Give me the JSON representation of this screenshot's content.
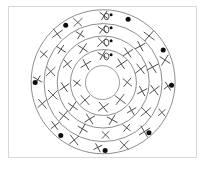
{
  "figure": {
    "background_color": "#ffffff",
    "border_color": "#d8d8d8",
    "ring_stroke_color": "#7a7a7a",
    "x_mark_color": "#4a4a4a",
    "dot_color": "#0d0d0d",
    "center_x": 103,
    "center_y": 82,
    "ring_count": 5,
    "label_text": "X0",
    "label_count": 4
  },
  "chart_data": {
    "type": "scatter",
    "xlabel": "",
    "ylabel": "",
    "grid": false,
    "legend": null,
    "coordinate_system": "polar",
    "center": {
      "x": 103,
      "y": 82
    },
    "rings": [
      {
        "name": "ring-1-outer",
        "radius": 72
      },
      {
        "name": "ring-2",
        "radius": 59
      },
      {
        "name": "ring-3",
        "radius": 46
      },
      {
        "name": "ring-4",
        "radius": 33
      },
      {
        "name": "ring-5-core",
        "radius": 17
      }
    ],
    "series": [
      {
        "name": "x-marks",
        "marker": "x",
        "color": "#4a4a4a",
        "points": [
          {
            "r": 65.5,
            "theta": 90
          },
          {
            "r": 65.5,
            "theta": 112
          },
          {
            "r": 65.5,
            "theta": 133
          },
          {
            "r": 65.5,
            "theta": 155
          },
          {
            "r": 65.5,
            "theta": 178
          },
          {
            "r": 65.5,
            "theta": 200
          },
          {
            "r": 65.5,
            "theta": 222
          },
          {
            "r": 65.5,
            "theta": 244
          },
          {
            "r": 65.5,
            "theta": 266
          },
          {
            "r": 65.5,
            "theta": 288
          },
          {
            "r": 65.5,
            "theta": 310
          },
          {
            "r": 65.5,
            "theta": 333
          },
          {
            "r": 65.5,
            "theta": 356
          },
          {
            "r": 65.5,
            "theta": 20
          },
          {
            "r": 65.5,
            "theta": 44
          },
          {
            "r": 52.5,
            "theta": 90
          },
          {
            "r": 52.5,
            "theta": 116
          },
          {
            "r": 52.5,
            "theta": 142
          },
          {
            "r": 52.5,
            "theta": 168
          },
          {
            "r": 52.5,
            "theta": 194
          },
          {
            "r": 52.5,
            "theta": 220
          },
          {
            "r": 52.5,
            "theta": 246
          },
          {
            "r": 52.5,
            "theta": 272
          },
          {
            "r": 52.5,
            "theta": 298
          },
          {
            "r": 52.5,
            "theta": 324
          },
          {
            "r": 52.5,
            "theta": 350
          },
          {
            "r": 52.5,
            "theta": 16
          },
          {
            "r": 52.5,
            "theta": 44
          },
          {
            "r": 39.5,
            "theta": 90
          },
          {
            "r": 39.5,
            "theta": 122
          },
          {
            "r": 39.5,
            "theta": 154
          },
          {
            "r": 39.5,
            "theta": 186
          },
          {
            "r": 39.5,
            "theta": 218
          },
          {
            "r": 39.5,
            "theta": 250
          },
          {
            "r": 39.5,
            "theta": 282
          },
          {
            "r": 39.5,
            "theta": 314
          },
          {
            "r": 39.5,
            "theta": 346
          },
          {
            "r": 39.5,
            "theta": 18
          },
          {
            "r": 39.5,
            "theta": 50
          },
          {
            "r": 25.5,
            "theta": 90
          },
          {
            "r": 25.5,
            "theta": 135
          },
          {
            "r": 25.5,
            "theta": 180
          },
          {
            "r": 25.5,
            "theta": 225
          },
          {
            "r": 25.5,
            "theta": 270
          },
          {
            "r": 25.5,
            "theta": 315
          },
          {
            "r": 25.5,
            "theta": 0
          },
          {
            "r": 25.5,
            "theta": 45
          }
        ]
      },
      {
        "name": "filled-dots",
        "marker": "circle-filled",
        "color": "#0d0d0d",
        "points": [
          {
            "r": 68,
            "theta": 68
          },
          {
            "r": 68,
            "theta": 123
          },
          {
            "r": 68,
            "theta": 180
          },
          {
            "r": 68,
            "theta": 232
          },
          {
            "r": 68,
            "theta": 272
          },
          {
            "r": 68,
            "theta": 312
          },
          {
            "r": 68,
            "theta": 357
          },
          {
            "r": 68,
            "theta": 28
          }
        ]
      }
    ],
    "annotations": [
      {
        "text": "X0",
        "r": 65.5,
        "theta": 90
      },
      {
        "text": "X0",
        "r": 52.5,
        "theta": 90
      },
      {
        "text": "X0",
        "r": 39.5,
        "theta": 90
      },
      {
        "text": "X0",
        "r": 25.5,
        "theta": 90
      }
    ]
  }
}
